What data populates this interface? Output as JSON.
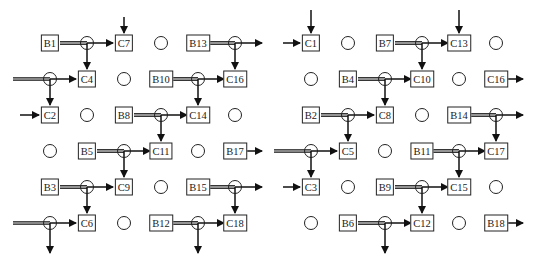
{
  "diagram": {
    "cols_left": [
      50,
      87,
      124,
      161,
      198,
      235
    ],
    "cols_right": [
      311,
      348,
      385,
      422,
      459,
      496
    ],
    "rows": [
      43,
      79,
      115,
      151,
      187,
      223
    ],
    "left": {
      "nodes": [
        {
          "label": "B1",
          "r": 0,
          "c": 0
        },
        {
          "label": "C7",
          "r": 0,
          "c": 2
        },
        {
          "label": "B13",
          "r": 0,
          "c": 4
        },
        {
          "label": "C4",
          "r": 1,
          "c": 1
        },
        {
          "label": "B10",
          "r": 1,
          "c": 3
        },
        {
          "label": "C16",
          "r": 1,
          "c": 5
        },
        {
          "label": "C2",
          "r": 2,
          "c": 0
        },
        {
          "label": "B8",
          "r": 2,
          "c": 2
        },
        {
          "label": "C14",
          "r": 2,
          "c": 4
        },
        {
          "label": "B5",
          "r": 3,
          "c": 1
        },
        {
          "label": "C11",
          "r": 3,
          "c": 3
        },
        {
          "label": "B17",
          "r": 3,
          "c": 5
        },
        {
          "label": "B3",
          "r": 4,
          "c": 0
        },
        {
          "label": "C9",
          "r": 4,
          "c": 2
        },
        {
          "label": "B15",
          "r": 4,
          "c": 4
        },
        {
          "label": "C6",
          "r": 5,
          "c": 1
        },
        {
          "label": "B12",
          "r": 5,
          "c": 3
        },
        {
          "label": "C18",
          "r": 5,
          "c": 5
        }
      ],
      "empty_circles": [
        [
          0,
          3
        ],
        [
          1,
          2
        ],
        [
          2,
          1
        ],
        [
          2,
          5
        ],
        [
          3,
          0
        ],
        [
          3,
          4
        ],
        [
          4,
          3
        ],
        [
          5,
          2
        ]
      ],
      "junctions": [
        [
          0,
          1
        ],
        [
          0,
          5
        ],
        [
          1,
          0
        ],
        [
          1,
          4
        ],
        [
          2,
          3
        ],
        [
          3,
          2
        ],
        [
          4,
          1
        ],
        [
          4,
          5
        ],
        [
          5,
          0
        ],
        [
          5,
          4
        ]
      ]
    },
    "right": {
      "nodes": [
        {
          "label": "C1",
          "r": 0,
          "c": 0
        },
        {
          "label": "B7",
          "r": 0,
          "c": 2
        },
        {
          "label": "C13",
          "r": 0,
          "c": 4
        },
        {
          "label": "B4",
          "r": 1,
          "c": 1
        },
        {
          "label": "C10",
          "r": 1,
          "c": 3
        },
        {
          "label": "C16",
          "r": 1,
          "c": 5
        },
        {
          "label": "B2",
          "r": 2,
          "c": 0
        },
        {
          "label": "C8",
          "r": 2,
          "c": 2
        },
        {
          "label": "B14",
          "r": 2,
          "c": 4
        },
        {
          "label": "C5",
          "r": 3,
          "c": 1
        },
        {
          "label": "B11",
          "r": 3,
          "c": 3
        },
        {
          "label": "C17",
          "r": 3,
          "c": 5
        },
        {
          "label": "C3",
          "r": 4,
          "c": 0
        },
        {
          "label": "B9",
          "r": 4,
          "c": 2
        },
        {
          "label": "C15",
          "r": 4,
          "c": 4
        },
        {
          "label": "B6",
          "r": 5,
          "c": 1
        },
        {
          "label": "C12",
          "r": 5,
          "c": 3
        },
        {
          "label": "B18",
          "r": 5,
          "c": 5
        }
      ],
      "empty_circles": [
        [
          0,
          1
        ],
        [
          0,
          5
        ],
        [
          1,
          0
        ],
        [
          1,
          4
        ],
        [
          2,
          3
        ],
        [
          3,
          2
        ],
        [
          4,
          1
        ],
        [
          4,
          5
        ],
        [
          5,
          0
        ],
        [
          5,
          4
        ]
      ],
      "junctions": [
        [
          0,
          3
        ],
        [
          1,
          2
        ],
        [
          2,
          1
        ],
        [
          2,
          5
        ],
        [
          3,
          0
        ],
        [
          3,
          4
        ],
        [
          4,
          3
        ],
        [
          5,
          2
        ]
      ]
    }
  }
}
